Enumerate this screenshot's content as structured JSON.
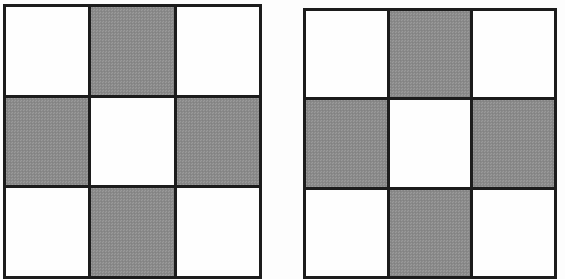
{
  "page": {
    "background_color": "#fdfdfd",
    "width": 565,
    "height": 271
  },
  "colors": {
    "border": "#1c1c1c",
    "filled_cell": "#8d8d8d",
    "empty_cell": "#fefefe",
    "background": "#fdfdfd"
  },
  "figures": [
    {
      "id": "grid-left",
      "name": "left-grid",
      "rows": 3,
      "columns": 3,
      "left": 3,
      "top": 4,
      "width": 259,
      "height": 275,
      "clipped_bottom": true,
      "pattern": [
        [
          "white",
          "gray",
          "white"
        ],
        [
          "gray",
          "white",
          "gray"
        ],
        [
          "white",
          "gray",
          "white"
        ]
      ],
      "cells": [
        {
          "row": 1,
          "col": 1,
          "state": "white",
          "label": ""
        },
        {
          "row": 1,
          "col": 2,
          "state": "gray",
          "label": ""
        },
        {
          "row": 1,
          "col": 3,
          "state": "white",
          "label": ""
        },
        {
          "row": 2,
          "col": 1,
          "state": "gray",
          "label": ""
        },
        {
          "row": 2,
          "col": 2,
          "state": "white",
          "label": ""
        },
        {
          "row": 2,
          "col": 3,
          "state": "gray",
          "label": ""
        },
        {
          "row": 3,
          "col": 1,
          "state": "white",
          "label": ""
        },
        {
          "row": 3,
          "col": 2,
          "state": "gray",
          "label": ""
        },
        {
          "row": 3,
          "col": 3,
          "state": "white",
          "label": ""
        }
      ]
    },
    {
      "id": "grid-right",
      "name": "right-grid",
      "rows": 3,
      "columns": 3,
      "left": 303,
      "top": 8,
      "width": 254,
      "height": 271,
      "clipped_bottom": true,
      "pattern": [
        [
          "white",
          "gray",
          "white"
        ],
        [
          "gray",
          "white",
          "gray"
        ],
        [
          "white",
          "gray",
          "white"
        ]
      ],
      "cells": [
        {
          "row": 1,
          "col": 1,
          "state": "white",
          "label": ""
        },
        {
          "row": 1,
          "col": 2,
          "state": "gray",
          "label": ""
        },
        {
          "row": 1,
          "col": 3,
          "state": "white",
          "label": ""
        },
        {
          "row": 2,
          "col": 1,
          "state": "gray",
          "label": ""
        },
        {
          "row": 2,
          "col": 2,
          "state": "white",
          "label": ""
        },
        {
          "row": 2,
          "col": 3,
          "state": "gray",
          "label": ""
        },
        {
          "row": 3,
          "col": 1,
          "state": "white",
          "label": ""
        },
        {
          "row": 3,
          "col": 2,
          "state": "gray",
          "label": ""
        },
        {
          "row": 3,
          "col": 3,
          "state": "white",
          "label": ""
        }
      ]
    }
  ]
}
